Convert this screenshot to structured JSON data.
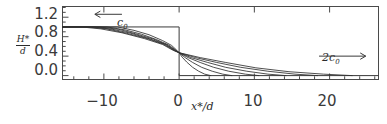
{
  "figure": {
    "title": "",
    "axis": {
      "y_label_numerator": "H*",
      "y_label_denominator": "d",
      "x_label": "x*/d",
      "y_ticks": [
        "0.0",
        "0.4",
        "0.8",
        "1.2"
      ],
      "x_ticks": [
        "−10",
        "0",
        "10",
        "20"
      ]
    },
    "annotations": {
      "left_label": "c",
      "left_sub": "0",
      "left_arrow_name": "left-arrow",
      "right_label": "2c",
      "right_sub": "0",
      "right_arrow_name": "right-arrow"
    }
  },
  "chart_data": {
    "type": "line",
    "title": "",
    "xlabel": "x*/d",
    "ylabel": "H*/d",
    "xlim": [
      -15.5,
      26.5
    ],
    "ylim": [
      -0.08,
      1.42
    ],
    "xticks": [
      -10,
      0,
      10,
      20
    ],
    "xticklabels": [
      "−10",
      "0",
      "10",
      "20"
    ],
    "yticks": [
      0.0,
      0.4,
      0.8,
      1.2
    ],
    "yticklabels": [
      "0.0",
      "0.4",
      "0.8",
      "1.2"
    ],
    "x_minor_tick_step": 2,
    "y_minor_tick_step": 0.1,
    "grid": false,
    "legend": false,
    "annotations": [
      {
        "text": "c0",
        "x": -6.5,
        "y": 1.28,
        "arrow": "left",
        "arrow_from_x": -7.6,
        "arrow_to_x": -11.2,
        "arrow_y": 1.26
      },
      {
        "text": "2c0",
        "x": 20.0,
        "y": 0.63,
        "arrow": "right",
        "arrow_from_x": 18.6,
        "arrow_to_x": 24.8,
        "arrow_y": 0.4
      }
    ],
    "initial_condition": {
      "name": "dam-break-step",
      "description": "Initial rectangular step: H*/d = 1 for x*/d < 0, H*/d = 0 for x*/d > 0",
      "left_level": 1.0,
      "right_level": 0.0,
      "step_x": 0.0,
      "left_extent": -15.5
    },
    "series": [
      {
        "name": "profile-t1",
        "x": [
          -15.5,
          -8.2,
          -6.0,
          -4.0,
          -2.2,
          -1.0,
          -0.3,
          0.0,
          0.4,
          1.0,
          1.8,
          2.6,
          3.4,
          4.2
        ],
        "y": [
          1.0,
          1.0,
          0.93,
          0.84,
          0.72,
          0.62,
          0.52,
          0.47,
          0.38,
          0.28,
          0.17,
          0.09,
          0.03,
          0.0
        ]
      },
      {
        "name": "profile-t2",
        "x": [
          -15.5,
          -9.6,
          -7.2,
          -5.0,
          -3.0,
          -1.4,
          -0.4,
          0.0,
          0.8,
          1.8,
          3.0,
          4.4,
          5.8,
          7.0
        ],
        "y": [
          1.0,
          1.0,
          0.94,
          0.85,
          0.74,
          0.63,
          0.52,
          0.47,
          0.37,
          0.27,
          0.17,
          0.09,
          0.03,
          0.0
        ]
      },
      {
        "name": "profile-t3",
        "x": [
          -15.5,
          -10.6,
          -8.0,
          -5.8,
          -3.4,
          -1.6,
          -0.5,
          0.0,
          1.2,
          2.8,
          4.6,
          6.6,
          8.8,
          10.6
        ],
        "y": [
          1.0,
          1.0,
          0.95,
          0.86,
          0.75,
          0.63,
          0.52,
          0.47,
          0.37,
          0.27,
          0.17,
          0.09,
          0.03,
          0.0
        ]
      },
      {
        "name": "profile-t4",
        "x": [
          -15.5,
          -11.4,
          -8.8,
          -6.4,
          -3.8,
          -1.8,
          -0.6,
          0.0,
          1.6,
          3.8,
          6.2,
          9.0,
          11.8,
          14.2
        ],
        "y": [
          1.0,
          1.0,
          0.95,
          0.87,
          0.75,
          0.64,
          0.52,
          0.47,
          0.37,
          0.27,
          0.17,
          0.09,
          0.03,
          0.0
        ]
      },
      {
        "name": "profile-t5",
        "x": [
          -15.5,
          -12.2,
          -9.6,
          -7.0,
          -4.2,
          -2.0,
          -0.7,
          0.0,
          2.2,
          5.0,
          8.2,
          11.8,
          15.4,
          18.4
        ],
        "y": [
          1.0,
          1.0,
          0.96,
          0.87,
          0.76,
          0.64,
          0.52,
          0.47,
          0.37,
          0.27,
          0.17,
          0.09,
          0.03,
          0.0
        ]
      },
      {
        "name": "profile-t6",
        "x": [
          -15.5,
          -13.0,
          -10.4,
          -7.6,
          -4.6,
          -2.2,
          -0.8,
          0.0,
          2.8,
          6.2,
          10.2,
          14.6,
          19.2,
          23.0
        ],
        "y": [
          1.0,
          1.0,
          0.96,
          0.88,
          0.76,
          0.64,
          0.52,
          0.47,
          0.37,
          0.27,
          0.16,
          0.08,
          0.03,
          0.0
        ]
      }
    ]
  }
}
